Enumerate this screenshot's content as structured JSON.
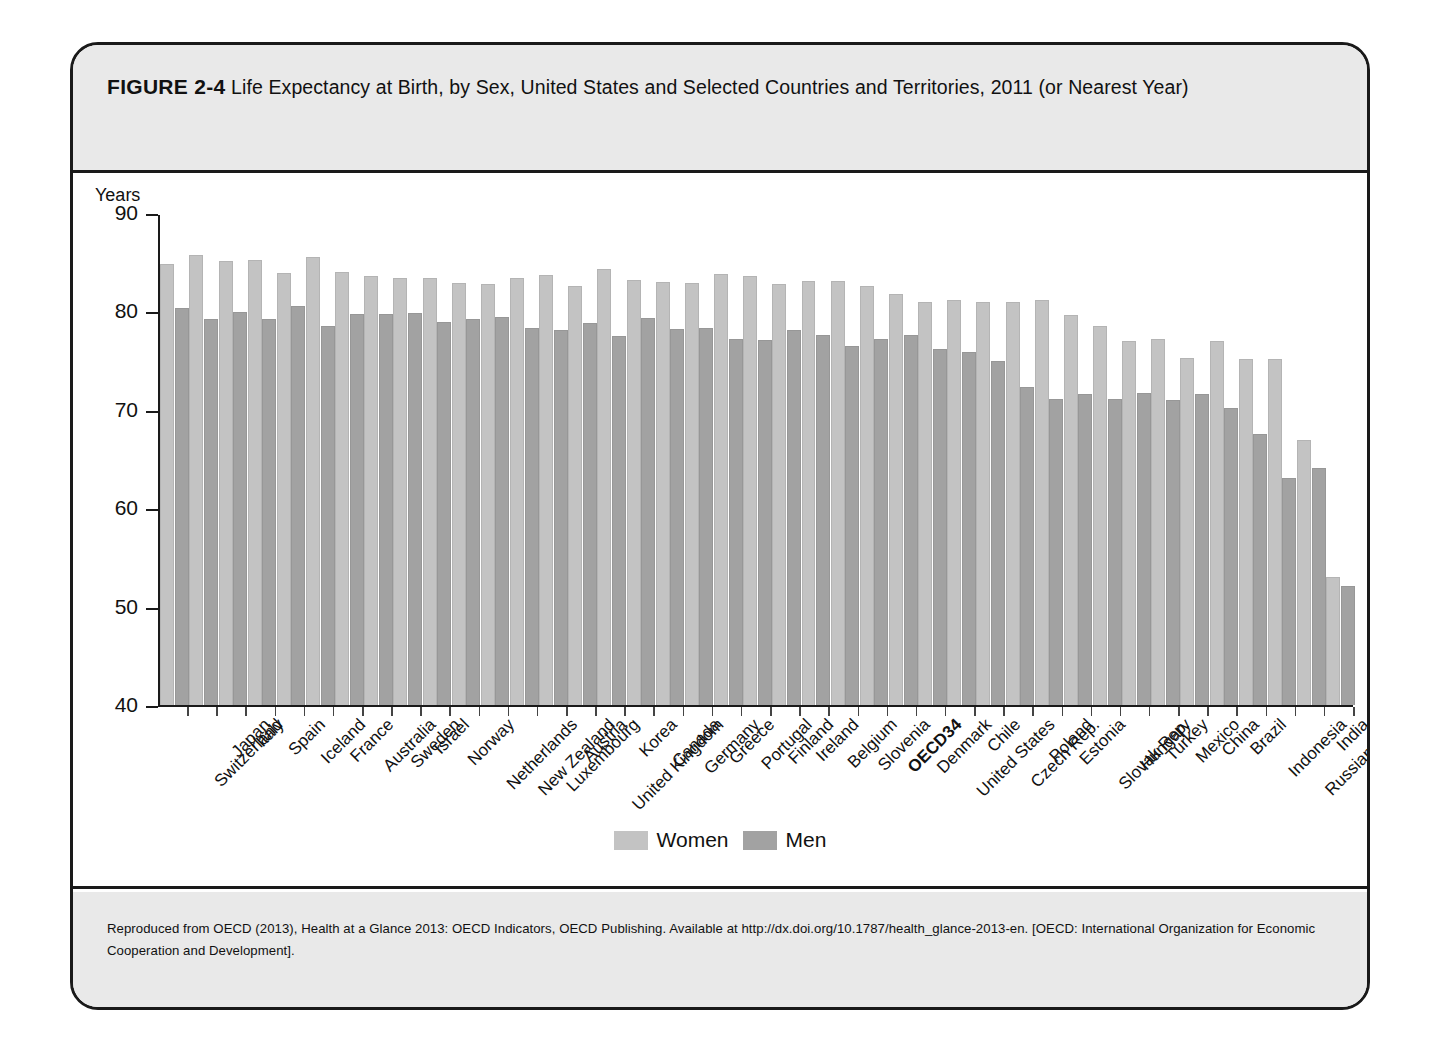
{
  "figure": {
    "label": "FIGURE 2-4",
    "title": "Life Expectancy at Birth, by Sex, United States and Selected Countries and Territories, 2011 (or Nearest Year)",
    "source_note": "Reproduced from OECD (2013), Health at a Glance 2013: OECD Indicators, OECD Publishing. Available at http://dx.doi.org/10.1787/health_glance-2013-en. [OECD: International Organization for Economic Cooperation and Development]."
  },
  "axis": {
    "y_title": "Years",
    "y_ticks": [
      "90",
      "80",
      "70",
      "60",
      "50",
      "40"
    ]
  },
  "legend": {
    "items": [
      {
        "label": "Women",
        "color": "#c3c3c3"
      },
      {
        "label": "Men",
        "color": "#a2a2a2"
      }
    ]
  },
  "colors": {
    "women": "#c3c3c3",
    "men": "#a2a2a2",
    "frame": "#1a1a1a",
    "band": "#e9e9e9",
    "background": "#ffffff"
  },
  "chart_data": {
    "type": "bar",
    "title": "Life Expectancy at Birth, by Sex, United States and Selected Countries and Territories, 2011 (or Nearest Year)",
    "xlabel": "",
    "ylabel": "Years",
    "ylim": [
      40,
      90
    ],
    "yticks": [
      40,
      50,
      60,
      70,
      80,
      90
    ],
    "grid": false,
    "legend_position": "bottom-center",
    "highlighted_category": "OECD34",
    "categories": [
      "Switzerland",
      "Japan",
      "Italy",
      "Spain",
      "Iceland",
      "France",
      "Australia",
      "Sweden",
      "Israel",
      "Norway",
      "Netherlands",
      "New Zealand",
      "Luxembourg",
      "Austria",
      "United Kingdom",
      "Korea",
      "Canada",
      "Germany",
      "Greece",
      "Portugal",
      "Finland",
      "Ireland",
      "Belgium",
      "Slovenia",
      "OECD34",
      "Denmark",
      "United States",
      "Chile",
      "Czech Rep.",
      "Poland",
      "Estonia",
      "Slovak Rep.",
      "Hungary",
      "Turkey",
      "Mexico",
      "China",
      "Brazil",
      "Indonesia",
      "Russian Fed.",
      "India",
      "South Africa"
    ],
    "series": [
      {
        "name": "Women",
        "color": "#c3c3c3",
        "values": [
          85.0,
          85.9,
          85.3,
          85.4,
          84.1,
          85.7,
          84.2,
          83.8,
          83.6,
          83.6,
          83.1,
          83.0,
          83.6,
          83.9,
          82.8,
          84.5,
          83.4,
          83.2,
          83.1,
          84.0,
          83.8,
          83.0,
          83.3,
          83.3,
          82.8,
          81.9,
          81.1,
          81.3,
          81.1,
          81.1,
          81.3,
          79.8,
          78.7,
          77.1,
          77.3,
          75.4,
          77.1,
          75.3,
          75.3,
          67.0,
          53.1
        ]
      },
      {
        "name": "Men",
        "color": "#a2a2a2",
        "values": [
          80.5,
          79.4,
          80.1,
          79.4,
          80.7,
          78.7,
          79.9,
          79.9,
          80.0,
          79.1,
          79.4,
          79.6,
          78.5,
          78.3,
          79.0,
          77.7,
          79.5,
          78.4,
          78.5,
          77.3,
          77.2,
          78.3,
          77.8,
          76.6,
          77.3,
          77.8,
          76.3,
          76.0,
          75.1,
          72.5,
          71.2,
          71.7,
          71.2,
          71.8,
          71.1,
          71.7,
          70.3,
          67.7,
          63.2,
          64.2,
          52.1
        ]
      }
    ]
  }
}
